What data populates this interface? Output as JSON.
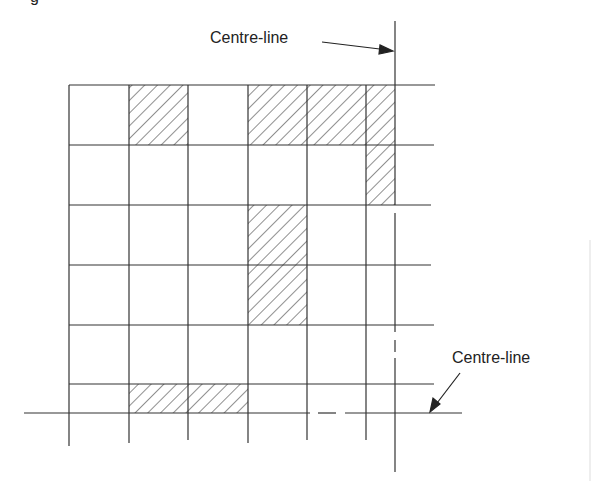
{
  "figure": {
    "caption_fragment": "g",
    "labels": {
      "vertical_centre_line": "Centre-line",
      "horizontal_centre_line": "Centre-line"
    },
    "grid": {
      "columns_x": [
        69,
        129,
        188,
        248,
        307,
        366
      ],
      "rows_y": [
        85,
        145,
        205,
        265,
        325,
        384
      ],
      "vertical_centre_line_x": 395,
      "horizontal_centre_line_y": 413
    },
    "hatched_cells": [
      {
        "x": 129,
        "y": 85,
        "w": 59,
        "h": 60
      },
      {
        "x": 248,
        "y": 85,
        "w": 59,
        "h": 60
      },
      {
        "x": 307,
        "y": 85,
        "w": 59,
        "h": 60
      },
      {
        "x": 366,
        "y": 85,
        "w": 29,
        "h": 120
      },
      {
        "x": 248,
        "y": 205,
        "w": 59,
        "h": 120
      },
      {
        "x": 129,
        "y": 384,
        "w": 119,
        "h": 29
      }
    ],
    "colors": {
      "line": "#333333",
      "hatch": "#444444"
    }
  }
}
